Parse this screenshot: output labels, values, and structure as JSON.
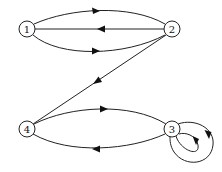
{
  "diagram": {
    "type": "directed-graph",
    "colors": {
      "stroke": "#222222",
      "fill": "#ffffff",
      "text": "#111111"
    },
    "nodes": [
      {
        "id": "1",
        "label": "1",
        "x": 27,
        "y": 29
      },
      {
        "id": "2",
        "label": "2",
        "x": 172,
        "y": 29
      },
      {
        "id": "3",
        "label": "3",
        "x": 172,
        "y": 129
      },
      {
        "id": "4",
        "label": "4",
        "x": 27,
        "y": 129
      }
    ],
    "edges": [
      {
        "from": "1",
        "to": "2",
        "shape": "upper-arc"
      },
      {
        "from": "2",
        "to": "1",
        "shape": "straight"
      },
      {
        "from": "1",
        "to": "2",
        "shape": "lower-arc"
      },
      {
        "from": "2",
        "to": "4",
        "shape": "straight"
      },
      {
        "from": "4",
        "to": "3",
        "shape": "upper-arc"
      },
      {
        "from": "3",
        "to": "4",
        "shape": "lower-arc"
      },
      {
        "from": "3",
        "to": "3",
        "shape": "self-loop-inner"
      },
      {
        "from": "3",
        "to": "3",
        "shape": "self-loop-outer"
      }
    ]
  }
}
